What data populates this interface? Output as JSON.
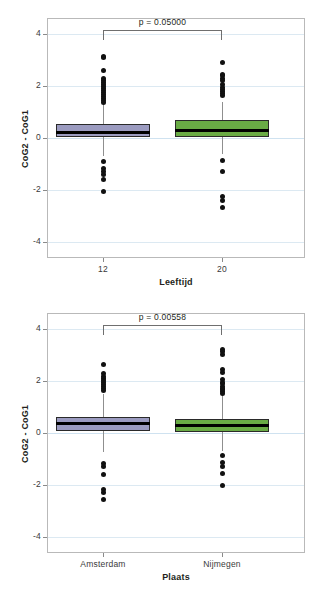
{
  "chart_data": [
    {
      "type": "box",
      "title": "",
      "xlabel": "Leeftijd",
      "ylabel": "CoG2 - CoG1",
      "ylim": [
        -4.6,
        4.6
      ],
      "yticks": [
        4,
        2,
        0,
        -2,
        -4
      ],
      "grid": true,
      "legend": "none",
      "annotation": "p = 0.05000",
      "categories": [
        "12",
        "20"
      ],
      "boxes": [
        {
          "category": "12",
          "color": "#9b9bc0",
          "q1": 0.05,
          "median": 0.22,
          "q3": 0.55,
          "whisker_low": -0.7,
          "whisker_high": 1.3,
          "outliers": [
            3.12,
            3.08,
            2.6,
            2.3,
            2.22,
            2.12,
            2.05,
            1.98,
            1.9,
            1.82,
            1.75,
            1.68,
            1.6,
            1.52,
            1.45,
            1.38,
            -0.9,
            -1.18,
            -1.28,
            -1.38,
            -1.6,
            -2.05
          ]
        },
        {
          "category": "20",
          "color": "#69ab45",
          "q1": 0.05,
          "median": 0.3,
          "q3": 0.68,
          "whisker_low": -0.62,
          "whisker_high": 1.38,
          "outliers": [
            2.9,
            2.45,
            2.38,
            2.28,
            2.2,
            2.05,
            1.95,
            1.85,
            1.78,
            1.7,
            1.62,
            -0.88,
            -1.3,
            -2.25,
            -2.38,
            -2.65
          ]
        }
      ]
    },
    {
      "type": "box",
      "title": "",
      "xlabel": "Plaats",
      "ylabel": "CoG2 - CoG1",
      "ylim": [
        -4.6,
        4.6
      ],
      "yticks": [
        4,
        2,
        0,
        -2,
        -4
      ],
      "grid": true,
      "legend": "none",
      "annotation": "p = 0.00558",
      "categories": [
        "Amsterdam",
        "Nijmegen"
      ],
      "boxes": [
        {
          "category": "Amsterdam",
          "color": "#9b9bc0",
          "q1": 0.08,
          "median": 0.38,
          "q3": 0.62,
          "whisker_low": -0.72,
          "whisker_high": 1.5,
          "outliers": [
            2.62,
            2.28,
            2.18,
            2.1,
            2.0,
            1.92,
            1.85,
            1.78,
            1.7,
            1.62,
            -1.18,
            -1.28,
            -1.58,
            -2.18,
            -2.28,
            -2.55
          ]
        },
        {
          "category": "Nijmegen",
          "color": "#69ab45",
          "q1": 0.02,
          "median": 0.28,
          "q3": 0.55,
          "whisker_low": -0.7,
          "whisker_high": 1.45,
          "outliers": [
            3.22,
            3.12,
            3.02,
            2.42,
            2.32,
            2.05,
            1.95,
            1.88,
            1.8,
            1.72,
            1.65,
            1.58,
            1.5,
            -0.85,
            -1.12,
            -1.28,
            -1.55,
            -2.02
          ]
        }
      ]
    }
  ],
  "panels": [
    {
      "name": "leeftijd-panel",
      "xlabel": "Leeftijd",
      "ylabel": "CoG2 - CoG1",
      "pvalue": "p = 0.05000",
      "xticks": [
        "12",
        "20"
      ],
      "yticks": [
        "4",
        "2",
        "0",
        "-2",
        "-4"
      ]
    },
    {
      "name": "plaats-panel",
      "xlabel": "Plaats",
      "ylabel": "CoG2 - CoG1",
      "pvalue": "p = 0.00558",
      "xticks": [
        "Amsterdam",
        "Nijmegen"
      ],
      "yticks": [
        "4",
        "2",
        "0",
        "-2",
        "-4"
      ]
    }
  ],
  "colors": {
    "box_purple": "#9b9bc0",
    "box_green": "#69ab45",
    "median": "#000000",
    "outlier": "#111111",
    "gridline": "#dce9f2",
    "frame": "#b9b9b9"
  }
}
